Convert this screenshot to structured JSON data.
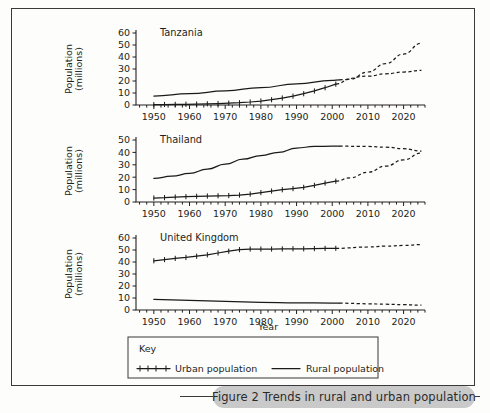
{
  "figure": {
    "caption_number": "Figure 2",
    "caption_text": "Figure 2  Trends in rural and urban population",
    "xlabel": "Year",
    "ylabel_line1": "Population",
    "ylabel_line2": "(millions)"
  },
  "legend": {
    "title": "Key",
    "entries": [
      {
        "label": "Urban population",
        "style": "line-with-cross-markers"
      },
      {
        "label": "Rural population",
        "style": "plain-line"
      }
    ]
  },
  "chart_data": [
    {
      "type": "line",
      "title": "Tanzania",
      "xlabel": "Year",
      "ylabel": "Population (millions)",
      "xlim": [
        1945,
        2026
      ],
      "ylim": [
        0,
        60
      ],
      "yticks": [
        0,
        10,
        20,
        30,
        40,
        50,
        60
      ],
      "xticks": [
        1950,
        1960,
        1970,
        1980,
        1990,
        2000,
        2010,
        2020
      ],
      "grid": false,
      "legend_position": "below-figure",
      "projection_starts": 2002,
      "series": [
        {
          "name": "Urban population",
          "style": "solid-with-markers",
          "x": [
            1950,
            1953,
            1956,
            1959,
            1962,
            1965,
            1968,
            1971,
            1974,
            1977,
            1980,
            1983,
            1986,
            1989,
            1992,
            1995,
            1998,
            2001
          ],
          "values": [
            0.3,
            0.4,
            0.5,
            0.6,
            0.8,
            1.0,
            1.2,
            1.5,
            1.9,
            2.5,
            3.3,
            4.4,
            5.8,
            7.4,
            9.4,
            11.7,
            14.4,
            17.4
          ]
        },
        {
          "name": "Urban population (projected)",
          "style": "dashed",
          "x": [
            2001,
            2005,
            2010,
            2015,
            2020,
            2025
          ],
          "values": [
            17.4,
            21.5,
            27.5,
            34.5,
            42.5,
            51.5
          ]
        },
        {
          "name": "Rural population",
          "style": "solid",
          "x": [
            1950,
            1960,
            1970,
            1980,
            1990,
            2000,
            2002
          ],
          "values": [
            7.5,
            9.4,
            11.8,
            14.5,
            17.6,
            20.5,
            21.0
          ]
        },
        {
          "name": "Rural population (projected)",
          "style": "dashed",
          "x": [
            2002,
            2010,
            2015,
            2020,
            2025
          ],
          "values": [
            21.0,
            24.0,
            26.0,
            27.5,
            28.8
          ]
        }
      ]
    },
    {
      "type": "line",
      "title": "Thailand",
      "xlabel": "Year",
      "ylabel": "Population (millions)",
      "xlim": [
        1945,
        2026
      ],
      "ylim": [
        0,
        50
      ],
      "yticks": [
        0,
        10,
        20,
        30,
        40,
        50
      ],
      "xticks": [
        1950,
        1960,
        1970,
        1980,
        1990,
        2000,
        2010,
        2020
      ],
      "grid": false,
      "legend_position": "below-figure",
      "projection_starts": 2002,
      "series": [
        {
          "name": "Urban population",
          "style": "solid-with-markers",
          "x": [
            1950,
            1953,
            1956,
            1959,
            1962,
            1965,
            1968,
            1971,
            1974,
            1977,
            1980,
            1983,
            1986,
            1989,
            1992,
            1995,
            1998,
            2001
          ],
          "values": [
            3.2,
            3.5,
            4.0,
            4.3,
            4.6,
            4.8,
            5.0,
            5.2,
            5.6,
            6.4,
            7.6,
            8.8,
            9.9,
            10.8,
            11.8,
            13.4,
            15.3,
            16.8
          ]
        },
        {
          "name": "Urban population (projected)",
          "style": "dashed",
          "x": [
            2001,
            2005,
            2010,
            2015,
            2020,
            2025
          ],
          "values": [
            16.8,
            19.5,
            24.0,
            29.0,
            34.0,
            39.5
          ]
        },
        {
          "name": "Rural population",
          "style": "solid",
          "x": [
            1950,
            1955,
            1960,
            1965,
            1970,
            1975,
            1980,
            1985,
            1990,
            1995,
            2000,
            2002
          ],
          "values": [
            19.0,
            20.8,
            23.0,
            26.5,
            30.5,
            34.5,
            37.5,
            40.0,
            43.5,
            44.8,
            45.0,
            45.0
          ]
        },
        {
          "name": "Rural population (projected)",
          "style": "dashed",
          "x": [
            2002,
            2010,
            2015,
            2020,
            2025
          ],
          "values": [
            45.0,
            44.8,
            44.2,
            43.0,
            41.0
          ]
        }
      ]
    },
    {
      "type": "line",
      "title": "United Kingdom",
      "xlabel": "Year",
      "ylabel": "Population (millions)",
      "xlim": [
        1945,
        2026
      ],
      "ylim": [
        0,
        60
      ],
      "yticks": [
        0,
        10,
        20,
        30,
        40,
        50,
        60
      ],
      "xticks": [
        1950,
        1960,
        1970,
        1980,
        1990,
        2000,
        2010,
        2020
      ],
      "grid": false,
      "legend_position": "below-figure",
      "projection_starts": 2002,
      "series": [
        {
          "name": "Urban population",
          "style": "solid-with-markers",
          "x": [
            1950,
            1953,
            1956,
            1959,
            1962,
            1965,
            1968,
            1971,
            1974,
            1977,
            1980,
            1983,
            1986,
            1989,
            1992,
            1995,
            1998,
            2001
          ],
          "values": [
            41.0,
            42.0,
            43.0,
            43.8,
            44.8,
            46.0,
            47.5,
            49.0,
            50.3,
            50.8,
            50.8,
            50.8,
            50.9,
            51.0,
            51.0,
            51.2,
            51.3,
            51.4
          ]
        },
        {
          "name": "Urban population (projected)",
          "style": "dashed",
          "x": [
            2001,
            2010,
            2015,
            2020,
            2025
          ],
          "values": [
            51.4,
            52.5,
            53.2,
            53.8,
            54.5
          ]
        },
        {
          "name": "Rural population",
          "style": "solid",
          "x": [
            1950,
            1960,
            1970,
            1980,
            1990,
            2000,
            2002
          ],
          "values": [
            8.8,
            8.0,
            7.2,
            6.4,
            6.0,
            5.8,
            5.7
          ]
        },
        {
          "name": "Rural population (projected)",
          "style": "dashed",
          "x": [
            2002,
            2010,
            2015,
            2020,
            2025
          ],
          "values": [
            5.7,
            5.2,
            4.8,
            4.4,
            4.0
          ]
        }
      ]
    }
  ]
}
